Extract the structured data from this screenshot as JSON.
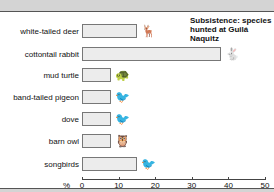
{
  "chart_data": {
    "type": "bar",
    "orientation": "horizontal",
    "categories": [
      "white-tailed deer",
      "cottontail rabbit",
      "mud turtle",
      "band-tailed pigeon",
      "dove",
      "barn owl",
      "songbirds"
    ],
    "values": [
      15,
      38,
      8,
      8,
      8,
      8,
      15
    ],
    "xlabel": "%",
    "ylabel": "",
    "xlim": [
      0,
      50
    ],
    "xticks": [
      0,
      10,
      20,
      30,
      40,
      50
    ],
    "grid": false,
    "legend": null,
    "icons": [
      "deer-icon",
      "rabbit-icon",
      "turtle-icon",
      "pigeon-icon",
      "dove-icon",
      "owl-icon",
      "songbird-icon"
    ]
  },
  "title_line1": "Subsistence: species",
  "title_line2": "hunted at Guilá Naquitz",
  "axis_unit": "%",
  "tick_labels": [
    "0",
    "10",
    "20",
    "30",
    "40",
    "50"
  ],
  "rows": [
    {
      "label": "white-tailed deer",
      "glyph": "🦌"
    },
    {
      "label": "cottontail rabbit",
      "glyph": "🐇"
    },
    {
      "label": "mud turtle",
      "glyph": "🐢"
    },
    {
      "label": "band-tailed pigeon",
      "glyph": "🐦"
    },
    {
      "label": "dove",
      "glyph": "🐦"
    },
    {
      "label": "barn owl",
      "glyph": "🦉"
    },
    {
      "label": "songbirds",
      "glyph": "🐦"
    }
  ]
}
